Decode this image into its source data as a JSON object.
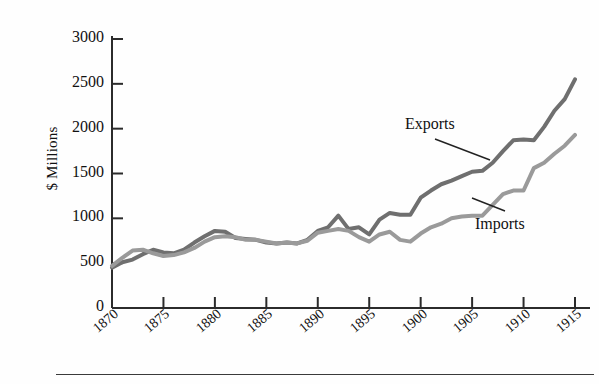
{
  "chart_data": {
    "type": "line",
    "title": "",
    "xlabel": "",
    "ylabel": "$ Millions",
    "xlim": [
      1870,
      1915
    ],
    "ylim": [
      0,
      3000
    ],
    "grid": false,
    "legend_position": "inline-annotations",
    "x_tick_labels": [
      "1870",
      "1875",
      "1880",
      "1885",
      "1890",
      "1895",
      "1900",
      "1905",
      "1910",
      "1915"
    ],
    "x_ticks": [
      1870,
      1875,
      1880,
      1885,
      1890,
      1895,
      1900,
      1905,
      1910,
      1915
    ],
    "y_tick_labels": [
      "0",
      "500",
      "1000",
      "1500",
      "2000",
      "2500",
      "3000"
    ],
    "y_ticks": [
      0,
      500,
      1000,
      1500,
      2000,
      2500,
      3000
    ],
    "x": [
      1870,
      1871,
      1872,
      1873,
      1874,
      1875,
      1876,
      1877,
      1878,
      1879,
      1880,
      1881,
      1882,
      1883,
      1884,
      1885,
      1886,
      1887,
      1888,
      1889,
      1890,
      1891,
      1892,
      1893,
      1894,
      1895,
      1896,
      1897,
      1898,
      1899,
      1900,
      1901,
      1902,
      1903,
      1904,
      1905,
      1906,
      1907,
      1908,
      1909,
      1910,
      1911,
      1912,
      1913,
      1914,
      1915
    ],
    "series": [
      {
        "name": "Exports",
        "color": "#6f6f6f",
        "values": [
          450,
          510,
          540,
          600,
          650,
          620,
          610,
          650,
          730,
          800,
          860,
          850,
          780,
          770,
          760,
          730,
          720,
          730,
          720,
          760,
          860,
          900,
          1030,
          880,
          900,
          820,
          985,
          1060,
          1040,
          1040,
          1230,
          1310,
          1380,
          1420,
          1470,
          1520,
          1530,
          1620,
          1750,
          1870,
          1880,
          1870,
          2020,
          2200,
          2330,
          2550
        ]
      },
      {
        "name": "Imports",
        "color": "#9a9a9a",
        "values": [
          470,
          560,
          640,
          650,
          610,
          580,
          590,
          620,
          670,
          740,
          790,
          800,
          790,
          760,
          760,
          740,
          720,
          730,
          720,
          750,
          840,
          860,
          880,
          860,
          790,
          740,
          820,
          850,
          760,
          740,
          830,
          900,
          940,
          1000,
          1020,
          1030,
          1030,
          1150,
          1270,
          1310,
          1310,
          1560,
          1620,
          1720,
          1810,
          1930
        ]
      }
    ],
    "annotations": [
      {
        "name": "exports-label",
        "text": "Exports",
        "x_px": 405,
        "y_px": 115,
        "leader_to": [
          490,
          160
        ]
      },
      {
        "name": "imports-label",
        "text": "Imports",
        "x_px": 475,
        "y_px": 215,
        "leader_to": [
          472,
          198
        ]
      }
    ]
  }
}
